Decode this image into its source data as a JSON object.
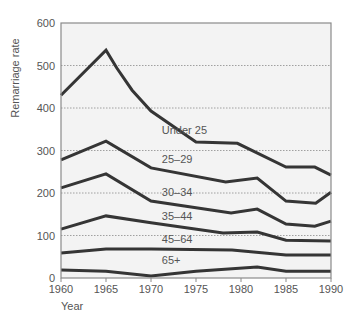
{
  "chart_data": {
    "type": "line",
    "title": "",
    "xlabel": "Year",
    "ylabel": "Remarriage rate",
    "xlim": [
      1960,
      1990
    ],
    "ylim": [
      0,
      600
    ],
    "x_ticks": [
      "1960",
      "1965",
      "1970",
      "1975",
      "1980",
      "1985",
      "1990"
    ],
    "y_ticks": [
      "0",
      "100",
      "200",
      "300",
      "400",
      "500",
      "600"
    ],
    "grid": {
      "horizontal": true,
      "style": "dotted",
      "values": [
        100,
        200,
        300,
        400,
        500
      ]
    },
    "legend": "inline labels above each line",
    "series": [
      {
        "name": "Under 25",
        "points": [
          [
            1960,
            430
          ],
          [
            1965,
            536
          ],
          [
            1966.2,
            494
          ],
          [
            1967.9,
            442
          ],
          [
            1970,
            393
          ],
          [
            1975,
            320
          ],
          [
            1979.6,
            317
          ],
          [
            1985,
            261
          ],
          [
            1988.2,
            261
          ],
          [
            1990,
            242
          ]
        ],
        "label_pos": [
          1971.2,
          338
        ]
      },
      {
        "name": "25–29",
        "points": [
          [
            1960,
            278
          ],
          [
            1965,
            322
          ],
          [
            1970,
            259
          ],
          [
            1978.3,
            226
          ],
          [
            1981.8,
            235
          ],
          [
            1985,
            181
          ],
          [
            1988.3,
            176
          ],
          [
            1990,
            202
          ]
        ],
        "label_pos": [
          1971.2,
          270
        ]
      },
      {
        "name": "30–34",
        "points": [
          [
            1960,
            212
          ],
          [
            1965,
            245
          ],
          [
            1970,
            181
          ],
          [
            1978.9,
            153
          ],
          [
            1981.8,
            162
          ],
          [
            1985,
            127
          ],
          [
            1988.2,
            122
          ],
          [
            1990,
            134
          ]
        ],
        "label_pos": [
          1971.2,
          192
        ]
      },
      {
        "name": "35–44",
        "points": [
          [
            1960,
            115
          ],
          [
            1965,
            146
          ],
          [
            1970,
            130
          ],
          [
            1978,
            106
          ],
          [
            1981.8,
            108
          ],
          [
            1985,
            89
          ],
          [
            1990,
            87
          ]
        ],
        "label_pos": [
          1971.2,
          137
        ]
      },
      {
        "name": "45–64",
        "points": [
          [
            1960,
            59
          ],
          [
            1965,
            68
          ],
          [
            1970,
            68
          ],
          [
            1979,
            66
          ],
          [
            1985,
            54
          ],
          [
            1990,
            54
          ]
        ],
        "label_pos": [
          1971.2,
          82
        ]
      },
      {
        "name": "65+",
        "points": [
          [
            1960,
            19
          ],
          [
            1965,
            16
          ],
          [
            1970,
            5
          ],
          [
            1975,
            16
          ],
          [
            1981.8,
            26
          ],
          [
            1985,
            16
          ],
          [
            1990,
            16
          ]
        ],
        "label_pos": [
          1971.2,
          34
        ]
      }
    ]
  },
  "colors": {
    "plot_background": "#f3f3f3",
    "frame": "#8a8a8a",
    "line": "#353535",
    "grid": "#8a8a8a",
    "text": "#555555"
  }
}
